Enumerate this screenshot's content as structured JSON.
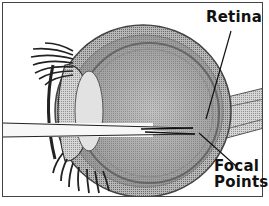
{
  "diagram": {
    "labels": {
      "retina": "Retina",
      "focal_points": "Focal Points"
    },
    "focal_points_lines": [
      "Focal",
      "Points"
    ],
    "colors": {
      "frame": "#444444",
      "background": "#ffffff",
      "eye_shade": "#9a9a9a",
      "label_text": "#111111"
    }
  }
}
